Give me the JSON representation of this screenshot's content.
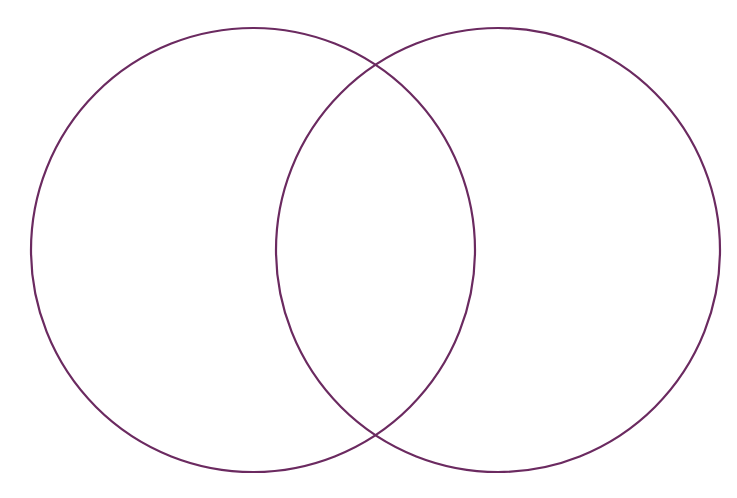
{
  "diagram": {
    "type": "venn",
    "canvas": {
      "width": 737,
      "height": 498,
      "background": "#ffffff"
    },
    "stroke_color": "#6b2a60",
    "stroke_width": 2.2,
    "circles": [
      {
        "id": "left",
        "cx": 253,
        "cy": 250,
        "r": 222,
        "label": ""
      },
      {
        "id": "right",
        "cx": 498,
        "cy": 250,
        "r": 222,
        "label": ""
      }
    ],
    "intersection_label": ""
  }
}
